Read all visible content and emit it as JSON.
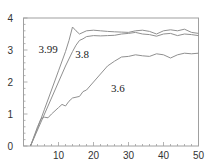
{
  "chart_data": {
    "type": "line",
    "title": "",
    "xlabel": "",
    "ylabel": "",
    "xlim": [
      0,
      50
    ],
    "ylim": [
      0,
      4
    ],
    "grid": false,
    "legend": "inline labels",
    "x_ticks": [
      10,
      20,
      30,
      40,
      50
    ],
    "y_ticks": [
      0,
      1,
      2,
      3,
      4
    ],
    "series": [
      {
        "name": "3.99",
        "label_pos": [
          4.3,
          2.9
        ],
        "x": [
          2,
          4,
          6,
          8,
          10,
          12,
          13,
          14,
          15,
          16,
          17,
          18,
          20,
          22,
          24,
          26,
          28,
          30,
          32,
          34,
          36,
          38,
          40,
          42,
          44,
          46,
          48,
          50
        ],
        "y": [
          0,
          0.55,
          1.15,
          1.75,
          2.35,
          2.95,
          3.3,
          3.72,
          3.6,
          3.5,
          3.55,
          3.6,
          3.62,
          3.6,
          3.58,
          3.57,
          3.56,
          3.55,
          3.6,
          3.62,
          3.58,
          3.5,
          3.6,
          3.63,
          3.6,
          3.65,
          3.55,
          3.52
        ]
      },
      {
        "name": "3.8",
        "label_pos": [
          14.8,
          2.75
        ],
        "x": [
          2,
          4,
          6,
          8,
          10,
          12,
          14,
          15,
          16,
          17,
          18,
          20,
          22,
          24,
          26,
          28,
          30,
          32,
          34,
          36,
          38,
          40,
          42,
          44,
          46,
          48,
          50
        ],
        "y": [
          0,
          0.5,
          1.0,
          1.5,
          2.0,
          2.5,
          2.95,
          3.15,
          3.3,
          3.35,
          3.42,
          3.45,
          3.44,
          3.45,
          3.46,
          3.5,
          3.52,
          3.55,
          3.5,
          3.48,
          3.43,
          3.5,
          3.52,
          3.45,
          3.5,
          3.48,
          3.45
        ]
      },
      {
        "name": "3.6",
        "label_pos": [
          25,
          1.7
        ],
        "x": [
          2,
          4,
          5,
          6,
          7,
          8,
          10,
          11,
          12,
          13,
          14,
          16,
          17,
          18,
          20,
          22,
          24,
          26,
          28,
          30,
          32,
          34,
          36,
          38,
          40,
          42,
          44,
          46,
          48,
          50
        ],
        "y": [
          0,
          0.6,
          0.85,
          0.9,
          0.88,
          1.0,
          1.2,
          1.3,
          1.25,
          1.4,
          1.5,
          1.55,
          1.7,
          1.75,
          2.0,
          2.25,
          2.5,
          2.65,
          2.78,
          2.8,
          2.85,
          2.82,
          2.8,
          2.88,
          2.85,
          2.75,
          2.85,
          2.9,
          2.88,
          2.9
        ]
      }
    ]
  },
  "axes": {
    "x_tick_labels": [
      "10",
      "20",
      "30",
      "40",
      "50"
    ],
    "y_tick_labels": [
      "0",
      "1",
      "2",
      "3",
      "4"
    ]
  },
  "colors": {
    "line": "#909090",
    "axis": "#a0a0a0",
    "text": "#333333"
  }
}
